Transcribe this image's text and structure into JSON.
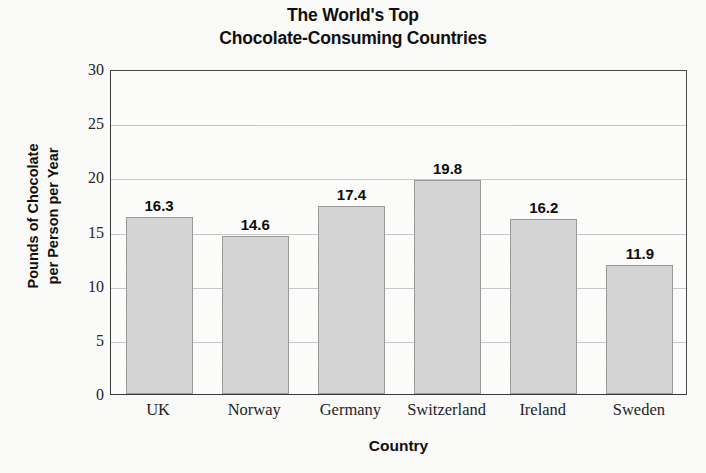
{
  "chart_data": {
    "type": "bar",
    "title": "The World's Top Chocolate-Consuming Countries",
    "title_lines": [
      "The World's Top",
      "Chocolate-Consuming Countries"
    ],
    "categories": [
      "UK",
      "Norway",
      "Germany",
      "Switzerland",
      "Ireland",
      "Sweden"
    ],
    "values": [
      16.3,
      14.6,
      17.4,
      19.8,
      16.2,
      11.9
    ],
    "value_labels": [
      "16.3",
      "14.6",
      "17.4",
      "19.8",
      "16.2",
      "11.9"
    ],
    "xlabel": "Country",
    "ylabel": "Pounds of Chocolate per Person per Year",
    "ylabel_lines": [
      "Pounds of Chocolate",
      "per Person per Year"
    ],
    "ylim": [
      0,
      30
    ],
    "ytick_values": [
      0,
      5,
      10,
      15,
      20,
      25,
      30
    ],
    "ytick_labels": [
      "0",
      "5",
      "10",
      "15",
      "20",
      "25",
      "30"
    ],
    "grid": "horizontal",
    "legend": "none",
    "bar_color": "#d6d6d6",
    "bar_edge_color": "#9a9a9a",
    "gridline_color": "#c9c9c9",
    "axis_color": "#3a3a3a",
    "background_color": "#fbfbfa"
  }
}
